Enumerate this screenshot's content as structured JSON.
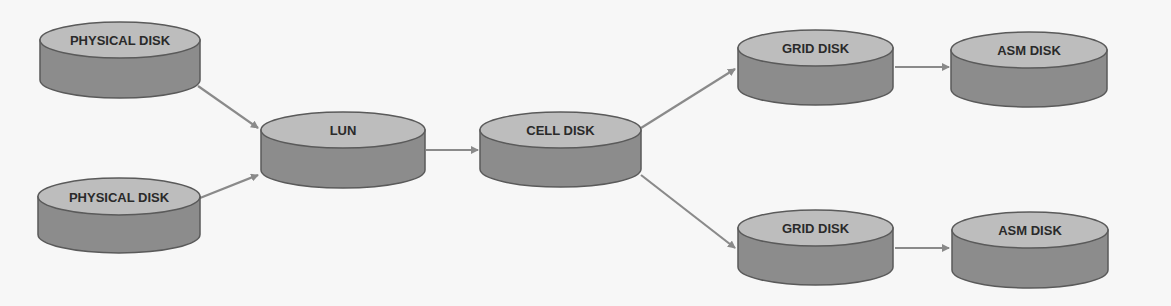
{
  "diagram": {
    "colors": {
      "background": "#f7f7f7",
      "cylinder_top": "#bdbdbd",
      "cylinder_side": "#8c8c8c",
      "outline": "#5a5a5a",
      "arrow": "#8a8a8a",
      "text": "#2a2a2a"
    },
    "nodes": [
      {
        "id": "physical-disk-1",
        "label": "PHYSICAL DISK",
        "x": 40,
        "y": 22,
        "w": 160,
        "top_h": 36,
        "h": 76
      },
      {
        "id": "physical-disk-2",
        "label": "PHYSICAL DISK",
        "x": 38,
        "y": 178,
        "w": 162,
        "top_h": 37,
        "h": 75
      },
      {
        "id": "lun",
        "label": "LUN",
        "x": 261,
        "y": 112,
        "w": 164,
        "top_h": 36,
        "h": 76
      },
      {
        "id": "cell-disk",
        "label": "CELL DISK",
        "x": 480,
        "y": 112,
        "w": 161,
        "top_h": 36,
        "h": 75
      },
      {
        "id": "grid-disk-1",
        "label": "GRID DISK",
        "x": 738,
        "y": 30,
        "w": 155,
        "top_h": 36,
        "h": 75
      },
      {
        "id": "asm-disk-1",
        "label": "ASM DISK",
        "x": 951,
        "y": 32,
        "w": 156,
        "top_h": 36,
        "h": 75
      },
      {
        "id": "grid-disk-2",
        "label": "GRID DISK",
        "x": 738,
        "y": 210,
        "w": 155,
        "top_h": 36,
        "h": 75
      },
      {
        "id": "asm-disk-2",
        "label": "ASM DISK",
        "x": 952,
        "y": 212,
        "w": 156,
        "top_h": 36,
        "h": 76
      }
    ],
    "edges": [
      {
        "from": "physical-disk-1",
        "to": "lun",
        "x1": 198,
        "y1": 86,
        "x2": 258,
        "y2": 128
      },
      {
        "from": "physical-disk-2",
        "to": "lun",
        "x1": 200,
        "y1": 198,
        "x2": 258,
        "y2": 175
      },
      {
        "from": "lun",
        "to": "cell-disk",
        "x1": 426,
        "y1": 150,
        "x2": 478,
        "y2": 150
      },
      {
        "from": "cell-disk",
        "to": "grid-disk-1",
        "x1": 641,
        "y1": 128,
        "x2": 735,
        "y2": 69
      },
      {
        "from": "cell-disk",
        "to": "grid-disk-2",
        "x1": 641,
        "y1": 175,
        "x2": 735,
        "y2": 248
      },
      {
        "from": "grid-disk-1",
        "to": "asm-disk-1",
        "x1": 895,
        "y1": 67,
        "x2": 949,
        "y2": 67
      },
      {
        "from": "grid-disk-2",
        "to": "asm-disk-2",
        "x1": 895,
        "y1": 248,
        "x2": 949,
        "y2": 248
      }
    ]
  }
}
